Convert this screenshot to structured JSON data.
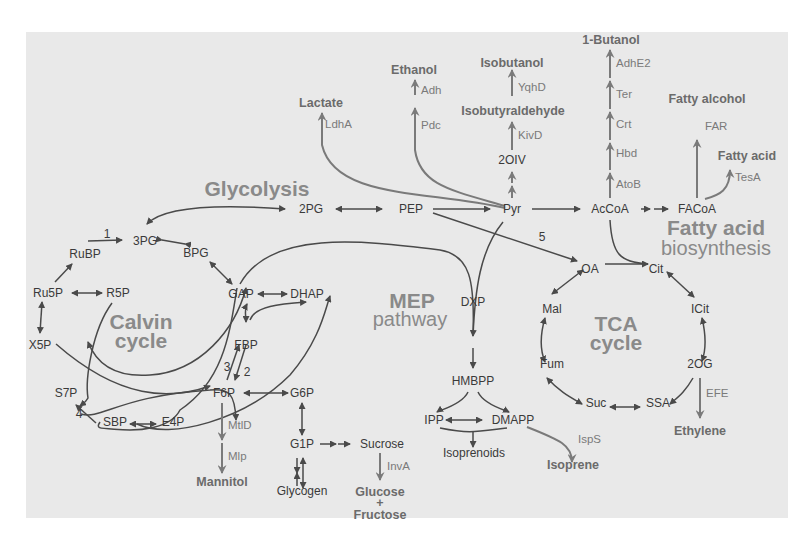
{
  "diagram": {
    "type": "metabolic-pathway-map",
    "regions": {
      "glycolysis": "Glycolysis",
      "calvin_line1": "Calvin",
      "calvin_line2": "cycle",
      "mep_line1": "MEP",
      "mep_line2": "pathway",
      "tca_line1": "TCA",
      "tca_line2": "cycle",
      "fa_line1": "Fatty acid",
      "fa_line2": "biosynthesis"
    },
    "metabolites": {
      "pg3": "3PG",
      "bpg": "BPG",
      "rubp": "RuBP",
      "ru5p": "Ru5P",
      "r5p": "R5P",
      "x5p": "X5P",
      "s7p": "S7P",
      "sbp": "SBP",
      "e4p": "E4P",
      "gap": "GAP",
      "dhap": "DHAP",
      "fbp": "FBP",
      "f6p": "F6P",
      "g6p": "G6P",
      "g1p": "G1P",
      "sucrose": "Sucrose",
      "glycogen": "Glycogen",
      "pg2": "2PG",
      "pep": "PEP",
      "pyr": "Pyr",
      "oiv2": "2OIV",
      "accoa": "AcCoA",
      "facoa": "FACoA",
      "dxp": "DXP",
      "hmbpp": "HMBPP",
      "ipp": "IPP",
      "dmapp": "DMAPP",
      "isoprenoids": "Isoprenoids",
      "oa": "OA",
      "cit": "Cit",
      "icit": "ICit",
      "og2": "2OG",
      "ssa": "SSA",
      "suc": "Suc",
      "fum": "Fum",
      "mal": "Mal"
    },
    "products": {
      "lactate": "Lactate",
      "ethanol": "Ethanol",
      "isobutanol": "Isobutanol",
      "isobutyraldehyde": "Isobutyraldehyde",
      "butanol": "1-Butanol",
      "fatty_alcohol": "Fatty alcohol",
      "fatty_acid": "Fatty acid",
      "mannitol": "Mannitol",
      "glucose": "Glucose",
      "plus": "+",
      "fructose": "Fructose",
      "isoprene": "Isoprene",
      "ethylene": "Ethylene"
    },
    "enzymes": {
      "ldha": "LdhA",
      "adh": "Adh",
      "pdc": "Pdc",
      "yqhd": "YqhD",
      "kivd": "KivD",
      "adhe2": "AdhE2",
      "ter": "Ter",
      "crt": "Crt",
      "hbd": "Hbd",
      "atob": "AtoB",
      "far": "FAR",
      "tesa": "TesA",
      "mtld": "MtlD",
      "mlp": "Mlp",
      "inva": "InvA",
      "isps": "IspS",
      "efe": "EFE"
    },
    "step_numbers": {
      "n1": "1",
      "n2": "2",
      "n3": "3",
      "n4": "4",
      "n5": "5"
    },
    "colors": {
      "background": "#e9e9e9",
      "metabolite": "#3a3a3a",
      "product": "#6b6b6b",
      "enzyme": "#7a7a7a",
      "region_title": "#8a8a8a"
    }
  }
}
